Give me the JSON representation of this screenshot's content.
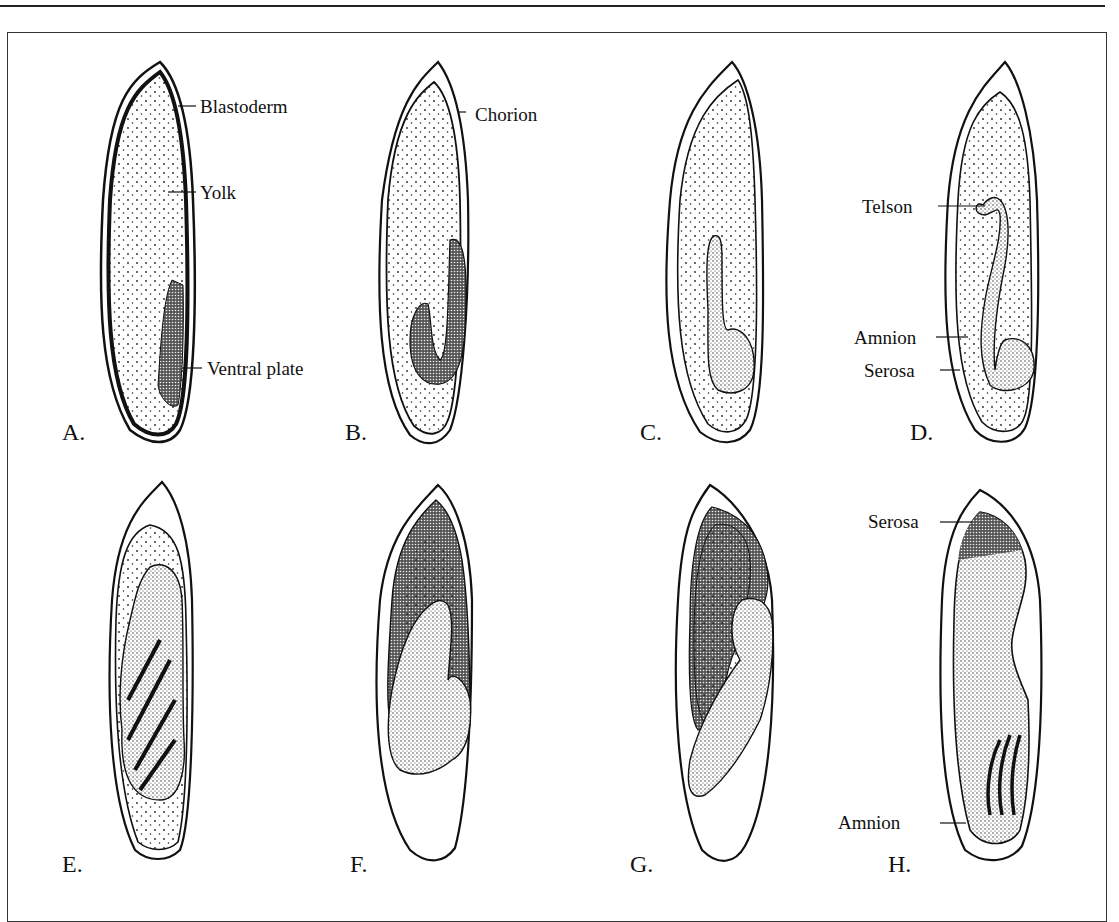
{
  "figure": {
    "ink_color": "#111111",
    "background_color": "#ffffff",
    "panels": [
      {
        "letter": "A.",
        "labels": [
          "Blastoderm",
          "Yolk",
          "Ventral plate"
        ]
      },
      {
        "letter": "B.",
        "labels": [
          "Chorion"
        ]
      },
      {
        "letter": "C.",
        "labels": []
      },
      {
        "letter": "D.",
        "labels": [
          "Telson",
          "Amnion",
          "Serosa"
        ]
      },
      {
        "letter": "E.",
        "labels": []
      },
      {
        "letter": "F.",
        "labels": []
      },
      {
        "letter": "G.",
        "labels": []
      },
      {
        "letter": "H.",
        "labels": [
          "Serosa",
          "Amnion"
        ]
      }
    ]
  }
}
